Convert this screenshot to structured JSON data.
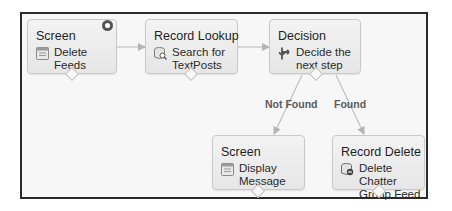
{
  "flow": {
    "nodes": [
      {
        "id": "screen1",
        "type": "Screen",
        "label": "Delete Feeds",
        "icon": "screen-icon",
        "start": true
      },
      {
        "id": "lookup",
        "type": "Record Lookup",
        "label_line1": "Search for",
        "label_line2": "TextPosts",
        "icon": "record-lookup-icon"
      },
      {
        "id": "decision",
        "type": "Decision",
        "label_line1": "Decide the",
        "label_line2": "next step",
        "icon": "decision-icon"
      },
      {
        "id": "screen2",
        "type": "Screen",
        "label_line1": "Display",
        "label_line2": "Message",
        "icon": "screen-icon"
      },
      {
        "id": "delete",
        "type": "Record Delete",
        "label_line1": "Delete Chatter",
        "label_line2": "Group Feed",
        "icon": "record-delete-icon"
      }
    ],
    "edges": [
      {
        "from": "screen1",
        "to": "lookup",
        "label": ""
      },
      {
        "from": "lookup",
        "to": "decision",
        "label": ""
      },
      {
        "from": "decision",
        "to": "screen2",
        "label": "Not Found"
      },
      {
        "from": "decision",
        "to": "delete",
        "label": "Found"
      }
    ]
  },
  "colors": {
    "frame_border": "#2a2a2a",
    "canvas": "#f7f7f7",
    "node_fill": "#ececec",
    "connector": "#b5b5b5",
    "edge_label": "#5a5a5a"
  }
}
